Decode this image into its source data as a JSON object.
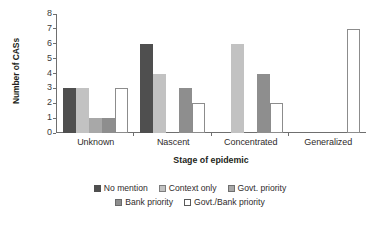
{
  "chart_data": {
    "type": "bar",
    "title": "",
    "xlabel": "Stage of epidemic",
    "ylabel": "Number of CASs",
    "ylim": [
      0,
      8
    ],
    "yticks": [
      0,
      1,
      2,
      3,
      4,
      5,
      6,
      7,
      8
    ],
    "grid": false,
    "legend_position": "bottom",
    "categories": [
      "Unknown",
      "Nascent",
      "Concentrated",
      "Generalized"
    ],
    "series": [
      {
        "name": "No mention",
        "color": "#4f4f4f",
        "values": [
          3,
          6,
          0,
          0
        ]
      },
      {
        "name": "Context only",
        "color": "#c2c2c2",
        "values": [
          3,
          4,
          6,
          0
        ]
      },
      {
        "name": "Govt. priority",
        "color": "#a8a8a8",
        "values": [
          1,
          0,
          0,
          0
        ]
      },
      {
        "name": "Bank priority",
        "color": "#8e8e8e",
        "values": [
          1,
          3,
          4,
          0
        ]
      },
      {
        "name": "Govt./Bank priority",
        "color": "#ffffff",
        "values": [
          3,
          2,
          2,
          7
        ]
      }
    ]
  }
}
